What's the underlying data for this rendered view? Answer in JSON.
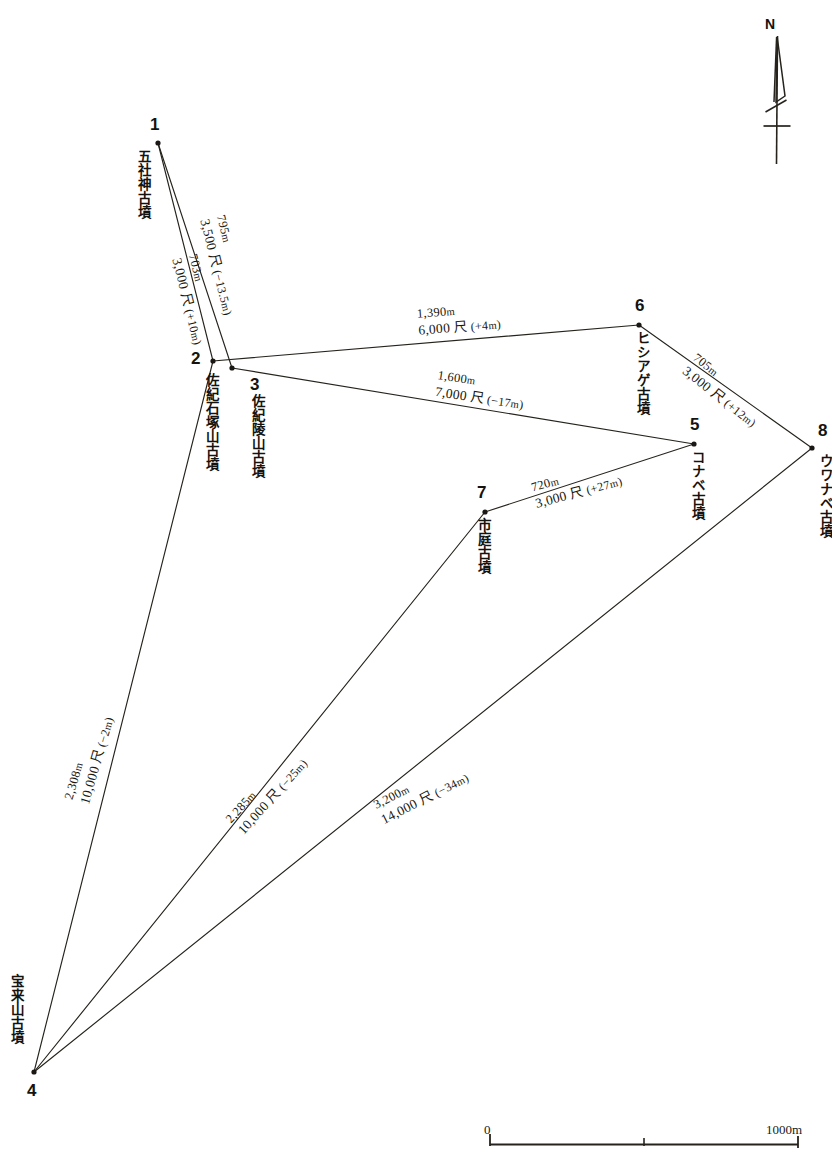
{
  "figure": {
    "type": "survey-map-diagram"
  },
  "north_arrow": {
    "label": "N"
  },
  "scale": {
    "min_label": "0",
    "max_label": "1000m",
    "tick_count": 2
  },
  "nodes": [
    {
      "id": "1",
      "number": "1",
      "name": "五社神古墳",
      "x": 158,
      "y": 143,
      "num_dx": -8,
      "num_dy": -27,
      "name_dx": -22,
      "name_dy": 6
    },
    {
      "id": "2",
      "number": "2",
      "name": "佐紀石塚山古墳",
      "x": 213,
      "y": 361,
      "num_dx": -22,
      "num_dy": -11,
      "name_dx": -9,
      "name_dy": 12
    },
    {
      "id": "3",
      "number": "3",
      "name": "佐紀陵山古墳",
      "x": 232,
      "y": 368,
      "num_dx": 18,
      "num_dy": 8,
      "name_dx": 18,
      "name_dy": 26
    },
    {
      "id": "4",
      "number": "4",
      "name": "宝来山古墳",
      "x": 34,
      "y": 1072,
      "num_dx": -7,
      "num_dy": 10,
      "name_dx": -25,
      "name_dy": -98
    },
    {
      "id": "5",
      "number": "5",
      "name": "コナベ古墳",
      "x": 694,
      "y": 444,
      "num_dx": -4,
      "num_dy": -28,
      "name_dx": -4,
      "name_dy": 6
    },
    {
      "id": "6",
      "number": "6",
      "name": "ヒシアゲ古墳",
      "x": 639,
      "y": 325,
      "num_dx": -4,
      "num_dy": -28,
      "name_dx": -4,
      "name_dy": 6
    },
    {
      "id": "7",
      "number": "7",
      "name": "市庭古墳",
      "x": 485,
      "y": 512,
      "num_dx": -8,
      "num_dy": -28,
      "name_dx": -9,
      "name_dy": 6
    },
    {
      "id": "8",
      "number": "8",
      "name": "ウワナベ古墳",
      "x": 812,
      "y": 448,
      "num_dx": 6,
      "num_dy": -26,
      "name_dx": 6,
      "name_dy": 6
    }
  ],
  "edges": [
    {
      "id": "1-3",
      "from": "1",
      "to": "3",
      "distance_m": "795m",
      "shaku": "3,500 尺",
      "delta": "(−13.5m)",
      "label_x": 196,
      "label_y": 205,
      "label_angle": 76
    },
    {
      "id": "1-2",
      "from": "1",
      "to": "2",
      "distance_m": "703m",
      "shaku": "3,000 尺",
      "delta": "(+10m)",
      "label_x": 168,
      "label_y": 244,
      "label_angle": 76
    },
    {
      "id": "2-6",
      "from": "2",
      "to": "6",
      "distance_m": "1,390m",
      "shaku": "6,000 尺",
      "delta": "(+4m)",
      "label_x": 419,
      "label_y": 323,
      "label_angle": -4.5
    },
    {
      "id": "3-5",
      "from": "3",
      "to": "5",
      "distance_m": "1,600m",
      "shaku": "7,000 尺",
      "delta": "(−17m)",
      "label_x": 434,
      "label_y": 384,
      "label_angle": 8.5
    },
    {
      "id": "6-8",
      "from": "6",
      "to": "8",
      "distance_m": "705m",
      "shaku": "3,000 尺",
      "delta": "(+12m)",
      "label_x": 679,
      "label_y": 360,
      "label_angle": 38
    },
    {
      "id": "7-5",
      "from": "7",
      "to": "5",
      "distance_m": "720m",
      "shaku": "3,000 尺",
      "delta": "(+27m)",
      "label_x": 538,
      "label_y": 496,
      "label_angle": -15
    },
    {
      "id": "4-2",
      "from": "4",
      "to": "2",
      "distance_m": "2,308m",
      "shaku": "10,000 尺",
      "delta": "(−2m)",
      "label_x": 93,
      "label_y": 790,
      "label_angle": -74
    },
    {
      "id": "4-7",
      "from": "4",
      "to": "7",
      "distance_m": "2,285m",
      "shaku": "10,000 尺",
      "delta": "(−25m)",
      "label_x": 247,
      "label_y": 822,
      "label_angle": -48
    },
    {
      "id": "4-8",
      "from": "4",
      "to": "8",
      "distance_m": "3,200m",
      "shaku": "14,000 尺",
      "delta": "(−34m)",
      "label_x": 386,
      "label_y": 812,
      "label_angle": -27
    }
  ],
  "colors": {
    "line": "#26231c",
    "text": "#15130f",
    "background": "#ffffff"
  }
}
